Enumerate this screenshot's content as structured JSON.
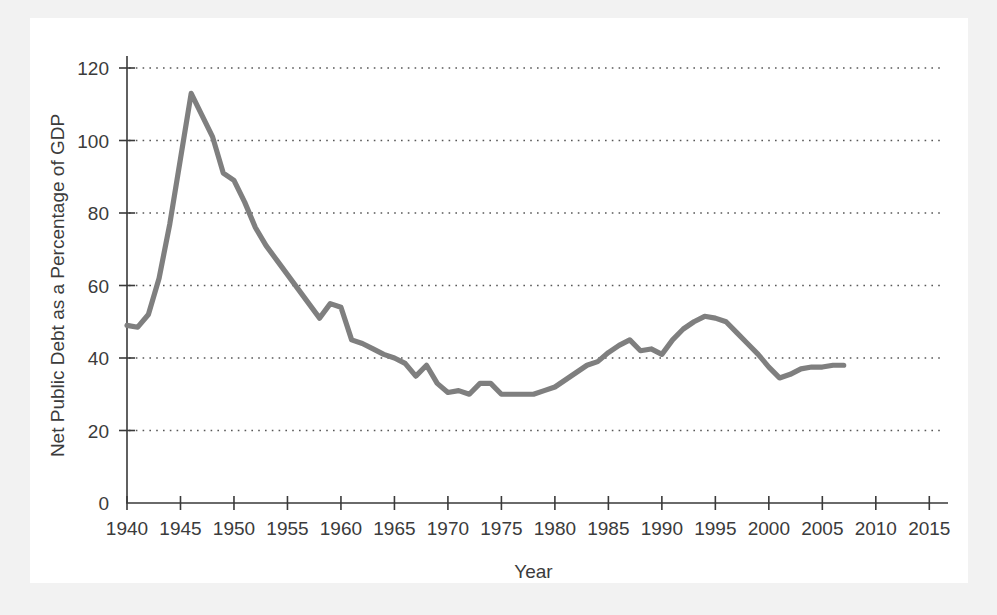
{
  "page": {
    "background_color": "#f2f2f2",
    "panel_color": "#ffffff"
  },
  "chart_data": {
    "type": "line",
    "title": "",
    "xlabel": "Year",
    "ylabel": "Net Public Debt as a Percentage of GDP",
    "xlim": [
      1940,
      2016
    ],
    "ylim": [
      0,
      124
    ],
    "xticks": [
      1940,
      1945,
      1950,
      1955,
      1960,
      1965,
      1970,
      1975,
      1980,
      1985,
      1990,
      1995,
      2000,
      2005,
      2010,
      2015
    ],
    "xtick_labels": [
      "1940",
      "1945",
      "1950",
      "1955",
      "1960",
      "1965",
      "1970",
      "1975",
      "1980",
      "1985",
      "1990",
      "1995",
      "2000",
      "2005",
      "2010",
      "2015"
    ],
    "yticks": [
      0,
      20,
      40,
      60,
      80,
      100,
      120
    ],
    "ytick_labels": [
      "0",
      "20",
      "40",
      "60",
      "80",
      "100",
      "120"
    ],
    "grid": "horizontal-dotted",
    "legend": "none",
    "line_color": "#7f7f7f",
    "axis_color": "#3a3a3a",
    "series": [
      {
        "name": "Net Public Debt as a Percentage of GDP",
        "x": [
          1940,
          1941,
          1942,
          1943,
          1944,
          1945,
          1946,
          1947,
          1948,
          1949,
          1950,
          1951,
          1952,
          1953,
          1954,
          1955,
          1956,
          1957,
          1958,
          1959,
          1960,
          1961,
          1962,
          1963,
          1964,
          1965,
          1966,
          1967,
          1968,
          1969,
          1970,
          1971,
          1972,
          1973,
          1974,
          1975,
          1976,
          1977,
          1978,
          1979,
          1980,
          1981,
          1982,
          1983,
          1984,
          1985,
          1986,
          1987,
          1988,
          1989,
          1990,
          1991,
          1992,
          1993,
          1994,
          1995,
          1996,
          1997,
          1998,
          1999,
          2000,
          2001,
          2002,
          2003,
          2004,
          2005,
          2006,
          2007
        ],
        "y": [
          49,
          48.5,
          52,
          62,
          77,
          95,
          113,
          107,
          101,
          91,
          89,
          83,
          76,
          71,
          67,
          63,
          59,
          55,
          51,
          55,
          54,
          45,
          44,
          42.5,
          41,
          40,
          38.5,
          35,
          38,
          33,
          30.5,
          31,
          30,
          33,
          33,
          30,
          30,
          30,
          30,
          31,
          32,
          34,
          36,
          38,
          39,
          41.5,
          43.5,
          45,
          42,
          42.5,
          41,
          45,
          48,
          50,
          51.5,
          51,
          50,
          47,
          44,
          41,
          37.5,
          34.5,
          35.5,
          37,
          37.5,
          37.5,
          38,
          38
        ]
      }
    ]
  }
}
